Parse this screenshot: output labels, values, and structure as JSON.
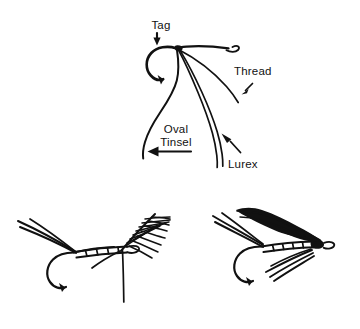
{
  "figure": {
    "background_color": "#ffffff",
    "ink_color": "#111111",
    "width": 360,
    "height": 329
  },
  "top_diagram": {
    "name": "tie-in-detail",
    "labels": [
      {
        "id": "tag",
        "text": "Tag",
        "x": 161,
        "y": 29,
        "anchor": "middle",
        "arrow": "down",
        "arrow_from": [
          157,
          33
        ],
        "arrow_to": [
          157,
          45
        ]
      },
      {
        "id": "thread",
        "text": "Thread",
        "x": 234,
        "y": 75,
        "anchor": "start",
        "arrow": "down-left",
        "arrow_from": [
          252,
          84
        ],
        "arrow_to": [
          240,
          95
        ]
      },
      {
        "id": "oval-tinsel-line1",
        "text": "Oval",
        "x": 176,
        "y": 133,
        "anchor": "middle",
        "arrow": "none"
      },
      {
        "id": "oval-tinsel-line2",
        "text": "Tinsel",
        "x": 176,
        "y": 146,
        "anchor": "middle",
        "arrow": "left",
        "arrow_from": [
          190,
          152
        ],
        "arrow_to": [
          148,
          152
        ]
      },
      {
        "id": "lurex",
        "text": "Lurex",
        "x": 228,
        "y": 168,
        "anchor": "start",
        "arrow": "up-left",
        "arrow_from": [
          240,
          153
        ],
        "arrow_to": [
          222,
          134
        ]
      }
    ],
    "parts": [
      "hook-eye-loop",
      "hook-shank",
      "hook-bend-curl",
      "thread-strand",
      "oval-tinsel-strand",
      "lurex-double-strand"
    ]
  },
  "bottom_left_fly": {
    "name": "fly-with-hackle",
    "caption": "",
    "body_segments": 5,
    "parts": [
      "tail-fibers",
      "segmented-body",
      "hackle-feather",
      "hook",
      "hook-eye"
    ]
  },
  "bottom_right_fly": {
    "name": "finished-wet-fly",
    "caption": "",
    "body_segments": 6,
    "parts": [
      "tail-fibers",
      "segmented-body",
      "dark-wing",
      "throat-hackle",
      "hook",
      "hook-eye"
    ]
  }
}
